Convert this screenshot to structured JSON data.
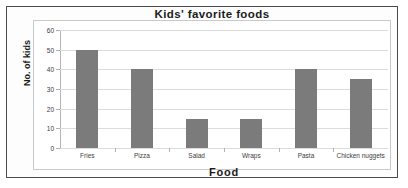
{
  "chart_data": {
    "type": "bar",
    "title": "Kids' favorite foods",
    "xlabel": "Food",
    "ylabel": "No. of kids",
    "categories": [
      "Fries",
      "Pizza",
      "Salad",
      "Wraps",
      "Pasta",
      "Chicken nuggets"
    ],
    "values": [
      50,
      40,
      15,
      15,
      40,
      35
    ],
    "ylim": [
      0,
      60
    ],
    "ytick_labels": [
      "0",
      "10",
      "20",
      "30",
      "40",
      "50",
      "60"
    ],
    "ytick_values": [
      0,
      10,
      20,
      30,
      40,
      50,
      60
    ],
    "grid": true,
    "legend": false,
    "bar_color": "#7b7b7b",
    "grid_color": "#dcdcdc",
    "frame_color": "#4a4a4a",
    "text_color": "#1b1b1b"
  }
}
